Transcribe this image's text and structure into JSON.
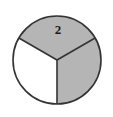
{
  "figure": {
    "title": "",
    "shape": "circle-divided-into-three-equal-sectors",
    "background_color": "#ffffff",
    "outline_color": "#333333",
    "outline_width": 1.6,
    "center": {
      "x": 57,
      "y": 60
    },
    "radius": 44
  },
  "chart_data": {
    "type": "pie",
    "title": "",
    "subtitle": "",
    "xlabel": "",
    "ylabel": "",
    "grid": false,
    "legend": "none",
    "total_slices": 3,
    "shaded_slices": 2,
    "unshaded_slices": 1,
    "fraction_shaded": "2/3",
    "categories": [
      "top",
      "right",
      "bottom-left"
    ],
    "values": [
      1,
      1,
      1
    ],
    "slice_angle_degrees": 120,
    "annotations": [
      {
        "text": "2",
        "slice": "top",
        "x": 58,
        "y": 31
      }
    ],
    "slices": [
      {
        "name": "top",
        "label": "2",
        "start_angle": 210,
        "end_angle": 330,
        "value": 1,
        "share": 0.3333,
        "fill": "#b5b5b5",
        "shaded": true
      },
      {
        "name": "right",
        "label": "",
        "start_angle": 330,
        "end_angle": 90,
        "value": 1,
        "share": 0.3333,
        "fill": "#b5b5b5",
        "shaded": true
      },
      {
        "name": "bottom-left",
        "label": "",
        "start_angle": 90,
        "end_angle": 210,
        "value": 1,
        "share": 0.3333,
        "fill": "#ffffff",
        "shaded": false
      }
    ]
  },
  "colors": {
    "shaded_fill": "#b5b5b5",
    "unshaded_fill": "#ffffff",
    "stroke": "#333333",
    "label_text": "#1a1a1a",
    "page_background": "#ffffff"
  }
}
